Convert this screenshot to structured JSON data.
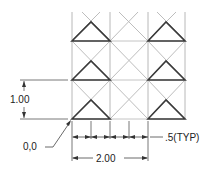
{
  "drawing": {
    "title": "Triangle pattern layout with dimensions",
    "colors": {
      "background": "#ffffff",
      "grid_line": "#b8b8b8",
      "diagonal_line": "#bdbdbd",
      "triangle_line": "#3a3a3a",
      "dimension_line": "#333333",
      "text": "#222222"
    },
    "grid": {
      "columns": 3,
      "rows": 3,
      "origin_label": "0,0"
    },
    "dimensions": {
      "vertical": {
        "value": "1.00"
      },
      "horizontal_total": {
        "value": "2.00"
      },
      "horizontal_step": {
        "value": ".5(TYP)"
      }
    },
    "origin_label": "0,0"
  }
}
